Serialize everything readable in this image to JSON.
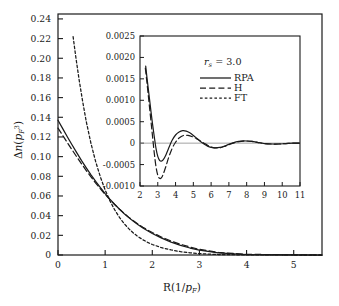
{
  "figure": {
    "background_color": "#ffffff",
    "line_color": "#1a1a1a"
  },
  "chart_data": {
    "type": "line",
    "title": "",
    "xlabel": "R(1/p_F)",
    "ylabel": "Δn(p_F³)",
    "xlim": [
      0,
      5.6
    ],
    "ylim": [
      0,
      0.245
    ],
    "grid": false,
    "legend_position": "inset-upper-right",
    "xticks": [
      0,
      1,
      2,
      3,
      4,
      5
    ],
    "xtick_labels": [
      "0",
      "1",
      "2",
      "3",
      "4",
      "5"
    ],
    "yticks": [
      0,
      0.02,
      0.04,
      0.06,
      0.08,
      0.1,
      0.12,
      0.14,
      0.16,
      0.18,
      0.2,
      0.22,
      0.24
    ],
    "ytick_labels": [
      "0",
      "0.02",
      "0.04",
      "0.06",
      "0.08",
      "0.10",
      "0.12",
      "0.14",
      "0.16",
      "0.18",
      "0.20",
      "0.22",
      "0.24"
    ],
    "series": [
      {
        "name": "RPA",
        "style": "solid",
        "x": [
          0,
          0.1,
          0.2,
          0.3,
          0.4,
          0.5,
          0.6,
          0.7,
          0.8,
          0.9,
          1.0,
          1.1,
          1.2,
          1.3,
          1.4,
          1.5,
          1.6,
          1.7,
          1.8,
          1.9,
          2.0,
          2.2,
          2.4,
          2.6,
          2.8,
          3.0,
          3.4,
          4.0,
          5.0,
          5.6
        ],
        "y": [
          0.137,
          0.1285,
          0.12,
          0.1118,
          0.1038,
          0.096,
          0.0886,
          0.0815,
          0.0748,
          0.0684,
          0.0624,
          0.0568,
          0.0516,
          0.0467,
          0.0422,
          0.038,
          0.0342,
          0.0307,
          0.0275,
          0.0246,
          0.0219,
          0.0171,
          0.0131,
          0.0098,
          0.0071,
          0.0049,
          0.0021,
          0.0005,
          0.0001,
          0.0
        ]
      },
      {
        "name": "H",
        "style": "dashed",
        "x": [
          0,
          0.1,
          0.2,
          0.3,
          0.4,
          0.5,
          0.6,
          0.7,
          0.8,
          0.9,
          1.0,
          1.1,
          1.2,
          1.3,
          1.4,
          1.5,
          1.6,
          1.7,
          1.8,
          1.9,
          2.0,
          2.2,
          2.4,
          2.6,
          2.8,
          3.0,
          3.4,
          4.0,
          5.0,
          5.6
        ],
        "y": [
          0.129,
          0.1215,
          0.1141,
          0.1068,
          0.0996,
          0.0926,
          0.0858,
          0.0793,
          0.0731,
          0.0672,
          0.0616,
          0.0563,
          0.0514,
          0.0468,
          0.0425,
          0.0385,
          0.0348,
          0.0314,
          0.0283,
          0.0254,
          0.0228,
          0.0181,
          0.0142,
          0.0109,
          0.0081,
          0.0057,
          0.0026,
          0.0007,
          0.0001,
          0.0
        ]
      },
      {
        "name": "FT",
        "style": "dotted",
        "x": [
          0.32,
          0.38,
          0.45,
          0.52,
          0.6,
          0.7,
          0.8,
          0.9,
          1.0,
          1.1,
          1.2,
          1.3,
          1.4,
          1.5,
          1.6,
          1.7,
          1.8,
          1.9,
          2.0,
          2.2,
          2.4,
          2.6,
          2.8,
          3.0,
          3.4,
          4.0,
          5.0,
          5.6
        ],
        "y": [
          0.222,
          0.2005,
          0.1775,
          0.157,
          0.1355,
          0.1133,
          0.0948,
          0.0792,
          0.0661,
          0.0552,
          0.0461,
          0.0385,
          0.0321,
          0.0268,
          0.0223,
          0.0186,
          0.0155,
          0.0129,
          0.0107,
          0.0074,
          0.0051,
          0.0034,
          0.0022,
          0.0014,
          0.0005,
          0.0001,
          0.0,
          0.0
        ]
      }
    ]
  },
  "inset": {
    "xlabel": "",
    "ylabel": "",
    "xlim": [
      2,
      11
    ],
    "ylim": [
      -0.001,
      0.0025
    ],
    "grid": false,
    "xticks": [
      2,
      3,
      4,
      5,
      6,
      7,
      8,
      9,
      10,
      11
    ],
    "xtick_labels": [
      "2",
      "3",
      "4",
      "5",
      "6",
      "7",
      "8",
      "9",
      "10",
      "11"
    ],
    "yticks": [
      -0.001,
      -0.0005,
      0,
      0.0005,
      0.001,
      0.0015,
      0.002,
      0.0025
    ],
    "ytick_labels": [
      "-0.0010",
      "-0.0005",
      "0",
      "0.0005",
      "0.0010",
      "0.0015",
      "0.0020",
      "0.0025"
    ],
    "annotation": "r_s = 3.0",
    "annotation_symbol": "r",
    "annotation_sub": "s",
    "annotation_value": "= 3.0",
    "legend": [
      {
        "label": "RPA",
        "style": "solid"
      },
      {
        "label": "H",
        "style": "dashed"
      },
      {
        "label": "FT",
        "style": "dotted"
      }
    ],
    "series": [
      {
        "name": "RPA",
        "style": "solid",
        "x": [
          2.32,
          2.4,
          2.5,
          2.6,
          2.7,
          2.8,
          2.9,
          3.0,
          3.1,
          3.2,
          3.3,
          3.45,
          3.6,
          3.8,
          4.0,
          4.2,
          4.4,
          4.6,
          4.8,
          5.0,
          5.2,
          5.4,
          5.6,
          5.8,
          6.0,
          6.2,
          6.5,
          6.8,
          7.1,
          7.4,
          7.7,
          8.0,
          8.3,
          8.6,
          9.0,
          9.4,
          9.8,
          10.2,
          10.6,
          11.0
        ],
        "y": [
          0.0018,
          0.0015,
          0.00115,
          0.0008,
          0.00046,
          0.00016,
          -0.00012,
          -0.00031,
          -0.0004,
          -0.00042,
          -0.00039,
          -0.00028,
          -0.00013,
          6e-05,
          0.00019,
          0.00026,
          0.00029,
          0.00028,
          0.00024,
          0.00018,
          0.00011,
          4e-05,
          -2e-05,
          -7e-05,
          -0.0001,
          -0.00011,
          -0.0001,
          -6e-05,
          -1e-05,
          3e-05,
          5e-05,
          5e-05,
          4e-05,
          2e-05,
          -1e-05,
          -2e-05,
          -2e-05,
          -1e-05,
          0.0,
          0.0
        ]
      },
      {
        "name": "H",
        "style": "dashed",
        "x": [
          2.3,
          2.4,
          2.5,
          2.6,
          2.7,
          2.8,
          2.9,
          3.0,
          3.1,
          3.2,
          3.3,
          3.45,
          3.6,
          3.8,
          4.0,
          4.2,
          4.45,
          4.7,
          4.95,
          5.2,
          5.4,
          5.6,
          5.8,
          6.0,
          6.2,
          6.5,
          6.8,
          7.1,
          7.4,
          7.7,
          8.0,
          8.3,
          8.6,
          9.0,
          9.4,
          9.8,
          10.2,
          10.6,
          11.0
        ],
        "y": [
          0.00175,
          0.00138,
          0.00098,
          0.00058,
          0.00018,
          -0.00022,
          -0.00055,
          -0.00075,
          -0.00082,
          -0.00081,
          -0.00073,
          -0.00055,
          -0.00035,
          -0.00013,
          2e-05,
          0.00012,
          0.00018,
          0.00018,
          0.00015,
          0.0001,
          5e-05,
          0.0,
          -5e-05,
          -9e-05,
          -0.00011,
          -0.00011,
          -7e-05,
          -2e-05,
          2e-05,
          4e-05,
          5e-05,
          4e-05,
          2e-05,
          -1e-05,
          -2e-05,
          -2e-05,
          -1e-05,
          0.0,
          0.0
        ]
      }
    ]
  }
}
